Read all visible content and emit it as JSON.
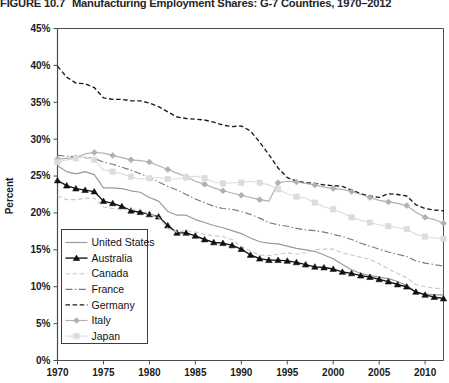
{
  "figure": {
    "number": "FIGURE 10.7",
    "title": "Manufacturing Employment Shares: G-7 Countries, 1970–2012"
  },
  "chart_data": {
    "type": "line",
    "title": "Manufacturing Employment Shares: G-7 Countries, 1970–2012",
    "xlabel": "",
    "ylabel": "Percent",
    "xlim": [
      1970,
      2012
    ],
    "ylim": [
      0,
      45
    ],
    "ytick_labels": [
      "0%",
      "5%",
      "10%",
      "15%",
      "20%",
      "25%",
      "30%",
      "35%",
      "40%",
      "45%"
    ],
    "yticks": [
      0,
      5,
      10,
      15,
      20,
      25,
      30,
      35,
      40,
      45
    ],
    "xticks": [
      1970,
      1975,
      1980,
      1985,
      1990,
      1995,
      2000,
      2005,
      2010
    ],
    "xtick_labels": [
      "1970",
      "1975",
      "1980",
      "1985",
      "1990",
      "1995",
      "2000",
      "2005",
      "2010"
    ],
    "grid": false,
    "legend_position": "lower-left",
    "x": [
      1970,
      1971,
      1972,
      1973,
      1974,
      1975,
      1976,
      1977,
      1978,
      1979,
      1980,
      1981,
      1982,
      1983,
      1984,
      1985,
      1986,
      1987,
      1988,
      1989,
      1990,
      1991,
      1992,
      1993,
      1994,
      1995,
      1996,
      1997,
      1998,
      1999,
      2000,
      2001,
      2002,
      2003,
      2004,
      2005,
      2006,
      2007,
      2008,
      2009,
      2010,
      2011,
      2012
    ],
    "series": [
      {
        "name": "United States",
        "color": "#999999",
        "style": "solid",
        "marker": "none",
        "values": [
          26.4,
          25.6,
          25.3,
          25.6,
          25.2,
          23.4,
          23.4,
          23.3,
          23.0,
          22.8,
          22.1,
          21.6,
          20.2,
          19.7,
          19.7,
          19.1,
          18.7,
          18.3,
          18.0,
          17.6,
          17.2,
          16.6,
          16.1,
          15.9,
          15.8,
          15.5,
          15.2,
          15.0,
          14.8,
          14.3,
          13.8,
          13.0,
          12.3,
          11.8,
          11.5,
          11.3,
          11.1,
          10.7,
          10.2,
          9.3,
          9.0,
          8.9,
          8.9
        ]
      },
      {
        "name": "Australia",
        "color": "#111111",
        "style": "solid",
        "marker": "triangle",
        "values": [
          24.4,
          23.7,
          23.3,
          23.1,
          22.9,
          21.6,
          21.3,
          20.9,
          20.3,
          20.1,
          19.8,
          19.5,
          18.3,
          17.3,
          17.3,
          16.9,
          16.4,
          16.0,
          15.9,
          15.6,
          15.1,
          14.3,
          13.8,
          13.6,
          13.6,
          13.5,
          13.3,
          13.0,
          12.7,
          12.6,
          12.4,
          12.0,
          11.8,
          11.5,
          11.3,
          11.0,
          10.7,
          10.3,
          10.0,
          9.3,
          8.9,
          8.6,
          8.4
        ]
      },
      {
        "name": "Canada",
        "color": "#c9c9c9",
        "style": "dashed",
        "marker": "none",
        "values": [
          22.3,
          21.8,
          21.8,
          22.0,
          22.0,
          20.8,
          20.6,
          20.4,
          20.5,
          20.5,
          19.8,
          19.4,
          17.9,
          17.4,
          17.6,
          17.4,
          17.1,
          16.9,
          16.8,
          16.4,
          15.5,
          14.8,
          14.3,
          14.2,
          14.4,
          14.6,
          14.4,
          14.6,
          15.0,
          15.1,
          15.1,
          14.6,
          14.3,
          14.0,
          13.7,
          13.1,
          12.4,
          11.8,
          11.2,
          10.3,
          10.0,
          9.8,
          9.7
        ]
      },
      {
        "name": "France",
        "color": "#7a7a7a",
        "style": "dashdot",
        "marker": "none",
        "values": [
          27.8,
          27.7,
          27.6,
          27.5,
          27.4,
          26.9,
          26.6,
          26.2,
          25.8,
          25.3,
          24.8,
          24.2,
          23.6,
          23.1,
          22.5,
          21.9,
          21.4,
          20.9,
          20.6,
          20.5,
          20.2,
          19.8,
          19.3,
          18.7,
          18.4,
          18.2,
          17.9,
          17.7,
          17.6,
          17.4,
          17.1,
          16.8,
          16.4,
          15.9,
          15.5,
          15.1,
          14.7,
          14.4,
          14.1,
          13.5,
          13.2,
          13.0,
          12.8
        ]
      },
      {
        "name": "Germany",
        "color": "#1a1a1a",
        "style": "dashed",
        "marker": "none",
        "values": [
          39.9,
          38.4,
          37.6,
          37.5,
          37.0,
          35.6,
          35.4,
          35.4,
          35.2,
          35.2,
          34.9,
          34.4,
          33.7,
          33.0,
          32.8,
          32.7,
          32.6,
          32.3,
          31.9,
          31.7,
          31.8,
          31.1,
          29.6,
          27.9,
          26.1,
          24.8,
          24.3,
          24.1,
          24.0,
          23.8,
          23.7,
          23.6,
          23.1,
          22.6,
          22.3,
          22.1,
          22.6,
          22.5,
          22.3,
          21.1,
          20.6,
          20.4,
          20.3
        ]
      },
      {
        "name": "Italy",
        "color": "#b0b0b0",
        "style": "solid",
        "marker": "diamond",
        "values": [
          27.3,
          27.4,
          27.5,
          28.0,
          28.2,
          28.1,
          27.8,
          27.5,
          27.2,
          27.1,
          26.9,
          26.4,
          25.9,
          25.4,
          24.9,
          24.3,
          23.9,
          23.4,
          23.0,
          22.7,
          22.4,
          22.1,
          21.8,
          21.6,
          24.1,
          24.3,
          24.2,
          24.0,
          23.8,
          23.5,
          23.3,
          23.2,
          22.9,
          22.5,
          22.1,
          21.7,
          21.5,
          21.3,
          21.0,
          20.1,
          19.4,
          19.1,
          18.6
        ]
      },
      {
        "name": "Japan",
        "color": "#dcdcdc",
        "style": "solid",
        "marker": "square",
        "values": [
          26.9,
          27.2,
          27.4,
          27.6,
          27.2,
          25.8,
          25.6,
          25.3,
          24.9,
          24.6,
          24.7,
          24.8,
          24.6,
          24.6,
          24.8,
          25.0,
          24.7,
          24.2,
          24.0,
          24.1,
          24.1,
          24.3,
          24.1,
          23.8,
          23.2,
          22.6,
          22.2,
          22.0,
          21.4,
          20.8,
          20.5,
          20.0,
          19.4,
          19.0,
          18.7,
          18.4,
          18.2,
          18.0,
          17.8,
          17.1,
          16.8,
          16.6,
          16.5
        ]
      }
    ]
  },
  "legend": {
    "items": [
      {
        "label": "United States"
      },
      {
        "label": "Australia"
      },
      {
        "label": "Canada"
      },
      {
        "label": "France"
      },
      {
        "label": "Germany"
      },
      {
        "label": "Italy"
      },
      {
        "label": "Japan"
      }
    ]
  }
}
